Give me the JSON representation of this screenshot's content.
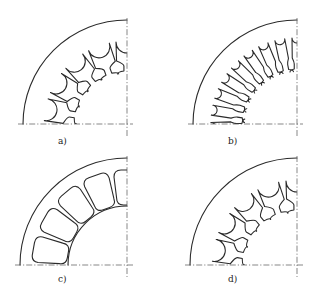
{
  "figure": {
    "line_color": "#2a2a2a",
    "axis_color": "#555555",
    "background": "#ffffff"
  },
  "panels": [
    {
      "id": "a",
      "label": "a)",
      "slot_style": "round-bottom slot with narrow neck and flared tooth tips",
      "center": [
        127,
        124
      ],
      "outer_radius": 104,
      "slot_bottom_radius": 93,
      "slot_top_radius": 50,
      "slot_count": 5,
      "slot_width": 22,
      "inner_bore": false,
      "label_pos": [
        58,
        136
      ]
    },
    {
      "id": "b",
      "label": "b)",
      "slot_style": "narrow parallel slots with flared tips",
      "center": [
        297,
        124
      ],
      "outer_radius": 104,
      "slot_bottom_radius": 91,
      "slot_top_radius": 52,
      "slot_count": 8,
      "slot_width": 10,
      "inner_bore": false,
      "label_pos": [
        228,
        136
      ]
    },
    {
      "id": "c",
      "label": "c)",
      "slot_style": "closed rounded-rectangle slots with inner bore",
      "center": [
        127,
        265
      ],
      "outer_radius": 107,
      "slot_bottom_radius": 95,
      "slot_top_radius": 58,
      "slot_count": 5,
      "slot_width": 26,
      "inner_bore": true,
      "inner_bore_radius": 59,
      "label_pos": [
        58,
        274
      ]
    },
    {
      "id": "d",
      "label": "d)",
      "slot_style": "open parallel slots with flared tips",
      "center": [
        297,
        265
      ],
      "outer_radius": 107,
      "slot_bottom_radius": 95,
      "slot_top_radius": 52,
      "slot_count": 5,
      "slot_width": 22,
      "inner_bore": false,
      "label_pos": [
        228,
        274
      ]
    }
  ]
}
